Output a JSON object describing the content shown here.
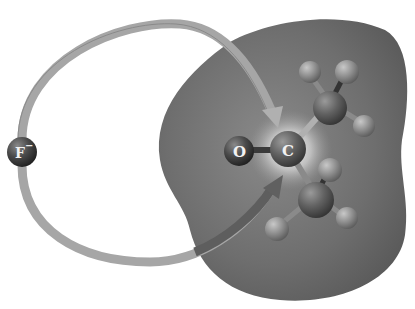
{
  "diagram": {
    "nucleophile": {
      "label": "F",
      "charge": "−"
    },
    "carbonyl": {
      "oxygen_label": "O",
      "carbon_label": "C"
    },
    "colors": {
      "surface": "#6e6e6e",
      "arrow": "#a8a8a8",
      "atom": "#4a4a4a",
      "hydrogen": "#8c8c8c",
      "highlight": "#f0f0f0"
    }
  }
}
